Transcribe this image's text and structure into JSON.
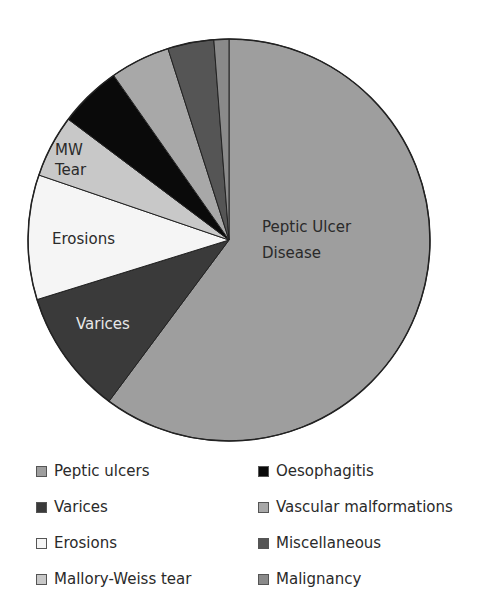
{
  "chart_data": {
    "type": "pie",
    "title": "",
    "start": "top",
    "direction": "clockwise",
    "slices": [
      {
        "name": "Peptic ulcers",
        "value": 60,
        "color": "#9e9e9e",
        "label": [
          "Peptic Ulcer",
          "Disease"
        ],
        "label_color": "#2a2a2a"
      },
      {
        "name": "Varices",
        "value": 10,
        "color": "#3a3a3a",
        "label": [
          "Varices"
        ],
        "label_color": "#e8e8e8"
      },
      {
        "name": "Erosions",
        "value": 10,
        "color": "#f5f5f5",
        "label": [
          "Erosions"
        ],
        "label_color": "#2a2a2a"
      },
      {
        "name": "Mallory-Weiss tear",
        "value": 5,
        "color": "#c8c8c8",
        "label": [
          "MW",
          "Tear"
        ],
        "label_color": "#2a2a2a"
      },
      {
        "name": "Oesophagitis",
        "value": 5,
        "color": "#0a0a0a",
        "label": [],
        "label_color": ""
      },
      {
        "name": "Vascular malformations",
        "value": 4.8,
        "color": "#a8a8a8",
        "label": [],
        "label_color": ""
      },
      {
        "name": "Miscellaneous",
        "value": 3.7,
        "color": "#555555",
        "label": [],
        "label_color": ""
      },
      {
        "name": "Malignancy",
        "value": 1.2,
        "color": "#8a8a8a",
        "label": [],
        "label_color": ""
      }
    ],
    "legend": {
      "placement": "bottom",
      "columns": [
        [
          "Peptic ulcers",
          "Varices",
          "Erosions",
          "Mallory-Weiss tear"
        ],
        [
          "Oesophagitis",
          "Vascular malformations",
          "Miscellaneous",
          "Malignancy"
        ]
      ]
    }
  }
}
